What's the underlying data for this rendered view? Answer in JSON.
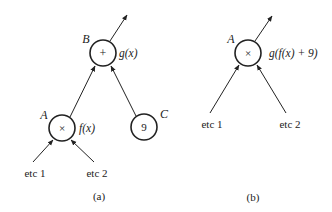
{
  "diagram_a": {
    "caption": "(a)",
    "nodes": [
      {
        "id": "B",
        "label": "B",
        "symbol": "+",
        "annotation": "g(x)"
      },
      {
        "id": "A",
        "label": "A",
        "symbol": "×",
        "annotation": "f(x)"
      },
      {
        "id": "C",
        "label": "C",
        "symbol": "9",
        "annotation": ""
      }
    ],
    "inputs": [
      {
        "label": "etc 1",
        "target": "A"
      },
      {
        "label": "etc 2",
        "target": "A"
      }
    ],
    "edges": [
      {
        "from": "A",
        "to": "B"
      },
      {
        "from": "C",
        "to": "B"
      },
      {
        "from": "B",
        "to": "output"
      }
    ]
  },
  "diagram_b": {
    "caption": "(b)",
    "nodes": [
      {
        "id": "A",
        "label": "A",
        "symbol": "×",
        "annotation": "g(f(x) + 9)"
      }
    ],
    "inputs": [
      {
        "label": "etc 1",
        "target": "A"
      },
      {
        "label": "etc 2",
        "target": "A"
      }
    ],
    "edges": [
      {
        "from": "A",
        "to": "output"
      }
    ]
  },
  "colors": {
    "stroke": "#222222",
    "background": "#ffffff"
  }
}
